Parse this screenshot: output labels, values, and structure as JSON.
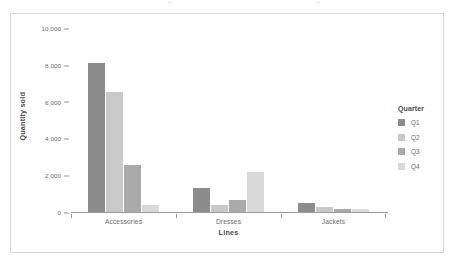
{
  "chart_data": {
    "type": "bar",
    "title": "",
    "xlabel": "Lines",
    "ylabel": "Quantity sold",
    "categories": [
      "Accessories",
      "Dresses",
      "Jackets"
    ],
    "series": [
      {
        "name": "Q1",
        "color": "#8c8c8c",
        "values": [
          8100,
          1300,
          500
        ]
      },
      {
        "name": "Q2",
        "color": "#c9c9c9",
        "values": [
          6500,
          380,
          250
        ]
      },
      {
        "name": "Q3",
        "color": "#aaaaaa",
        "values": [
          2550,
          680,
          160
        ]
      },
      {
        "name": "Q4",
        "color": "#d9d9d9",
        "values": [
          380,
          2200,
          180
        ]
      }
    ],
    "ylim": [
      0,
      10000
    ],
    "yticks": [
      0,
      2000,
      4000,
      6000,
      8000,
      10000
    ],
    "ytick_labels": [
      "0",
      "2,000",
      "4,000",
      "6,000",
      "8,000",
      "10,000"
    ],
    "grid": false,
    "legend_position": "right"
  },
  "legend": {
    "title": "Quarter",
    "items": [
      {
        "label": "Q1",
        "color": "#8c8c8c"
      },
      {
        "label": "Q2",
        "color": "#c9c9c9"
      },
      {
        "label": "Q3",
        "color": "#aaaaaa"
      },
      {
        "label": "Q4",
        "color": "#d9d9d9"
      }
    ]
  },
  "axes": {
    "y_title": "Quantity sold",
    "x_title": "Lines"
  }
}
